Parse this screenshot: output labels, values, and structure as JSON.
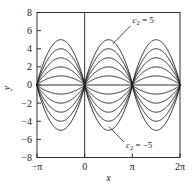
{
  "chart_data": {
    "type": "line",
    "title": "",
    "subtitle": "",
    "xlabel": "x",
    "ylabel": "y",
    "xlim": [
      -3.141592653589793,
      6.283185307179586
    ],
    "ylim": [
      -8,
      8
    ],
    "grid": false,
    "legend": null,
    "x_ticks": [
      -3.141592653589793,
      0,
      3.141592653589793,
      6.283185307179586
    ],
    "x_tick_labels": [
      "−π",
      "0",
      "π",
      "2π"
    ],
    "y_ticks": [
      -8,
      -6,
      -4,
      -2,
      0,
      2,
      4,
      6,
      8
    ],
    "y_tick_labels": [
      "−8",
      "−6",
      "−4",
      "−2",
      "0",
      "2",
      "4",
      "6",
      "8"
    ],
    "function": "y = c2 * sin(x)^2 * sign-free hump family; zeros at multiples of pi",
    "parameter_name": "c2",
    "parameter_values": [
      5,
      4,
      3,
      2,
      1,
      -1,
      -2,
      -3,
      -4,
      -5
    ],
    "series": [
      {
        "name": "c2 = 5",
        "c2": 5,
        "peak": 5
      },
      {
        "name": "c2 = 4",
        "c2": 4,
        "peak": 4
      },
      {
        "name": "c2 = 3",
        "c2": 3,
        "peak": 3
      },
      {
        "name": "c2 = 2",
        "c2": 2,
        "peak": 2
      },
      {
        "name": "c2 = 1",
        "c2": 1,
        "peak": 1
      },
      {
        "name": "c2 = -1",
        "c2": -1,
        "peak": -1
      },
      {
        "name": "c2 = -2",
        "c2": -2,
        "peak": -2
      },
      {
        "name": "c2 = -3",
        "c2": -3,
        "peak": -3
      },
      {
        "name": "c2 = -4",
        "c2": -4,
        "peak": -4
      },
      {
        "name": "c2 = -5",
        "c2": -5,
        "peak": -5
      }
    ],
    "line_color": "#1a1a1a",
    "background_color": "#ffffff",
    "annotations": [
      {
        "id": "upper",
        "symbol": "c",
        "subscript": "2",
        "equals": " = 5",
        "text": "c2 = 5",
        "text_x": 3.15,
        "text_y": 6.85,
        "leader_to_x": 1.85,
        "leader_to_y": 4.55
      },
      {
        "id": "lower",
        "symbol": "c",
        "subscript": "2",
        "equals": " = −5",
        "text": "c2 = -5",
        "text_x": 2.72,
        "text_y": -6.95,
        "leader_to_x": 1.6,
        "leader_to_y": -4.6
      }
    ]
  },
  "figure": {
    "axis_label_x": "x",
    "axis_label_y": "y"
  }
}
